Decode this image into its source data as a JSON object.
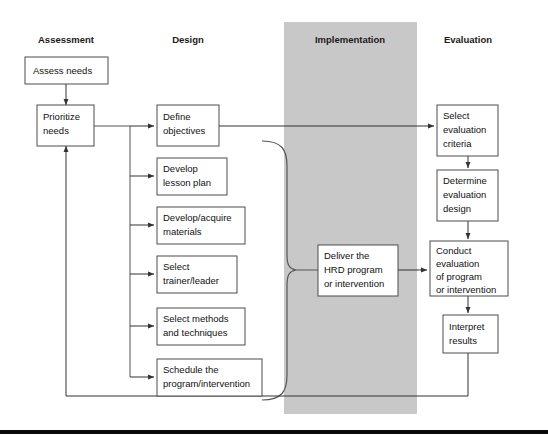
{
  "figure": {
    "accent_band_color": "#c8c8c8",
    "box_stroke_color": "#4d4d4d",
    "line_color": "#555555",
    "background_color": "#ffffff"
  },
  "columns": [
    {
      "key": "assessment",
      "label": "Assessment",
      "highlighted": "false"
    },
    {
      "key": "design",
      "label": "Design",
      "highlighted": "false"
    },
    {
      "key": "implementation",
      "label": "Implementation",
      "highlighted": "true"
    },
    {
      "key": "evaluation",
      "label": "Evaluation",
      "highlighted": "false"
    }
  ],
  "nodes": {
    "assess_needs": {
      "lines": [
        "Assess needs"
      ]
    },
    "prioritize_needs": {
      "lines": [
        "Prioritize",
        "needs"
      ]
    },
    "define_objectives": {
      "lines": [
        "Define",
        "objectives"
      ]
    },
    "develop_lesson_plan": {
      "lines": [
        "Develop",
        "lesson plan"
      ]
    },
    "develop_materials": {
      "lines": [
        "Develop/acquire",
        "materials"
      ]
    },
    "select_trainer": {
      "lines": [
        "Select",
        "trainer/leader"
      ]
    },
    "select_methods": {
      "lines": [
        "Select methods",
        "and techniques"
      ]
    },
    "schedule_program": {
      "lines": [
        "Schedule the",
        "program/intervention"
      ]
    },
    "deliver_program": {
      "lines": [
        "Deliver the",
        "HRD program",
        "or intervention"
      ]
    },
    "select_criteria": {
      "lines": [
        "Select",
        "evaluation",
        "criteria"
      ]
    },
    "determine_design": {
      "lines": [
        "Determine",
        "evaluation",
        "design"
      ]
    },
    "conduct_evaluation": {
      "lines": [
        "Conduct",
        "evaluation",
        "of program",
        "or intervention"
      ]
    },
    "interpret_results": {
      "lines": [
        "Interpret",
        "results"
      ]
    }
  }
}
